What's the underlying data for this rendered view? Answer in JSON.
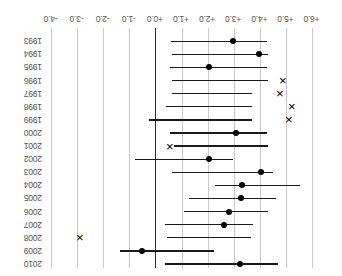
{
  "chart_data": {
    "type": "scatter",
    "title": "",
    "subtitle": "",
    "xlabel": "",
    "ylabel": "",
    "orientation": "horizontal-forest-plot",
    "rotated_180": true,
    "grid": true,
    "legend": null,
    "xlim": [
      6.5,
      -4.5
    ],
    "x_axis_direction": "decreasing-left-to-right",
    "xticks": [
      6.0,
      5.0,
      4.0,
      3.0,
      2.0,
      1.0,
      0.0,
      -1.0,
      -2.0,
      -3.0,
      -4.0
    ],
    "xticklabels": [
      "+6.0",
      "+5.0",
      "+4.0",
      "+3.0",
      "+2.0",
      "+1.0",
      "+0.0",
      "-1.0",
      "-2.0",
      "-3.0",
      "-4.0"
    ],
    "reference_line": 0.0,
    "categories": [
      "2010",
      "2009",
      "2008",
      "2007",
      "2006",
      "2005",
      "2004",
      "2003",
      "2002",
      "2001",
      "2000",
      "1999",
      "1998",
      "1997",
      "1996",
      "1995",
      "1994",
      "1993"
    ],
    "rows": [
      {
        "category": "2010",
        "marker": "dot",
        "estimate": 3.22,
        "ci_low": 0.35,
        "ci_high": 4.67
      },
      {
        "category": "2009",
        "marker": "dot",
        "estimate": -0.52,
        "ci_low": -1.38,
        "ci_high": 2.22
      },
      {
        "category": "2008",
        "marker": "cross",
        "estimate": -2.92,
        "ci_low": 0.41,
        "ci_high": 3.63
      },
      {
        "category": "2007",
        "marker": "dot",
        "estimate": 2.62,
        "ci_low": 0.36,
        "ci_high": 3.72
      },
      {
        "category": "2006",
        "marker": "dot",
        "estimate": 2.78,
        "ci_low": 1.06,
        "ci_high": 4.31
      },
      {
        "category": "2005",
        "marker": "dot",
        "estimate": 3.25,
        "ci_low": 1.26,
        "ci_high": 4.58
      },
      {
        "category": "2004",
        "marker": "dot",
        "estimate": 3.28,
        "ci_low": 2.25,
        "ci_high": 5.52
      },
      {
        "category": "2003",
        "marker": "dot",
        "estimate": 4.02,
        "ci_low": 0.63,
        "ci_high": 4.48
      },
      {
        "category": "2002",
        "marker": "dot",
        "estimate": 2.04,
        "ci_low": -0.8,
        "ci_high": 2.95
      },
      {
        "category": "2001",
        "marker": "cross",
        "estimate": 0.52,
        "ci_low": 0.68,
        "ci_high": 4.3
      },
      {
        "category": "2000",
        "marker": "dot",
        "estimate": 3.08,
        "ci_low": 0.55,
        "ci_high": 4.26
      },
      {
        "category": "1999",
        "marker": "cross",
        "estimate": 5.08,
        "ci_low": -0.28,
        "ci_high": 3.69
      },
      {
        "category": "1998",
        "marker": "cross",
        "estimate": 5.22,
        "ci_low": 0.4,
        "ci_high": 3.69
      },
      {
        "category": "1997",
        "marker": "cross",
        "estimate": 4.75,
        "ci_low": 0.6,
        "ci_high": 3.66
      },
      {
        "category": "1996",
        "marker": "cross",
        "estimate": 4.88,
        "ci_low": 0.62,
        "ci_high": 4.3
      },
      {
        "category": "1995",
        "marker": "dot",
        "estimate": 2.03,
        "ci_low": 0.55,
        "ci_high": 4.25
      },
      {
        "category": "1994",
        "marker": "dot",
        "estimate": 3.96,
        "ci_low": 0.6,
        "ci_high": 4.3
      },
      {
        "category": "1993",
        "marker": "dot",
        "estimate": 2.96,
        "ci_low": 0.58,
        "ci_high": 4.25
      }
    ]
  }
}
